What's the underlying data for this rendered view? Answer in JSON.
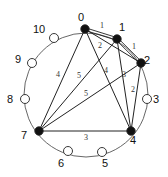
{
  "diagram": {
    "circle": {
      "cx": 86,
      "cy": 95,
      "r": 62
    },
    "nodes": [
      {
        "id": "0",
        "x": 85,
        "y": 29,
        "filled": true,
        "lx": 81,
        "ly": 21
      },
      {
        "id": "1",
        "x": 117,
        "y": 39,
        "filled": true,
        "lx": 122,
        "ly": 31
      },
      {
        "id": "2",
        "x": 141,
        "y": 63,
        "filled": true,
        "lx": 147,
        "ly": 64
      },
      {
        "id": "3",
        "x": 147,
        "y": 99,
        "filled": false,
        "lx": 156,
        "ly": 103
      },
      {
        "id": "4",
        "x": 131,
        "y": 131,
        "filled": true,
        "lx": 133,
        "ly": 144
      },
      {
        "id": "5",
        "x": 102,
        "y": 152,
        "filled": false,
        "lx": 105,
        "ly": 167
      },
      {
        "id": "6",
        "x": 68,
        "y": 151,
        "filled": false,
        "lx": 61,
        "ly": 167
      },
      {
        "id": "7",
        "x": 39,
        "y": 131,
        "filled": true,
        "lx": 24,
        "ly": 139
      },
      {
        "id": "8",
        "x": 25,
        "y": 99,
        "filled": false,
        "lx": 10,
        "ly": 103
      },
      {
        "id": "9",
        "x": 32,
        "y": 63,
        "filled": false,
        "lx": 18,
        "ly": 63
      },
      {
        "id": "10",
        "x": 54,
        "y": 38,
        "filled": false,
        "lx": 39,
        "ly": 33
      }
    ],
    "edges": [
      {
        "from": "0",
        "to": "1",
        "label": "1",
        "lx": 102,
        "ly": 28
      },
      {
        "from": "1",
        "to": "2",
        "label": "1",
        "lx": 134,
        "ly": 49
      },
      {
        "from": "0",
        "to": "2",
        "label": "2",
        "lx": 100,
        "ly": 48
      },
      {
        "from": "1",
        "to": "4",
        "label": "3",
        "lx": 124,
        "ly": 77
      },
      {
        "from": "2",
        "to": "4",
        "label": "2",
        "lx": 133,
        "ly": 92
      },
      {
        "from": "0",
        "to": "4",
        "label": "4",
        "lx": 106,
        "ly": 73
      },
      {
        "from": "0",
        "to": "7",
        "label": "4",
        "lx": 58,
        "ly": 77
      },
      {
        "from": "1",
        "to": "7",
        "label": "5",
        "lx": 79,
        "ly": 78
      },
      {
        "from": "2",
        "to": "7",
        "label": "5",
        "lx": 86,
        "ly": 96
      },
      {
        "from": "7",
        "to": "4",
        "label": "3",
        "lx": 86,
        "ly": 140
      }
    ],
    "double_edges": [
      {
        "from": "0",
        "to": "1"
      },
      {
        "from": "1",
        "to": "2"
      }
    ]
  }
}
